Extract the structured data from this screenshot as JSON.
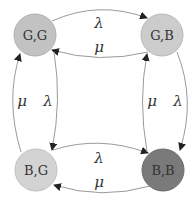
{
  "diagram": {
    "type": "state-transition",
    "nodes": [
      {
        "id": "GG",
        "label": "G,G",
        "fill": "#c2c2c2"
      },
      {
        "id": "GB",
        "label": "G,B",
        "fill": "#cccccc"
      },
      {
        "id": "BG",
        "label": "B,G",
        "fill": "#d3d3d3"
      },
      {
        "id": "BB",
        "label": "B,B",
        "fill": "#7a7a7a"
      }
    ],
    "edges": [
      {
        "from": "GG",
        "to": "GB",
        "label": "λ"
      },
      {
        "from": "GB",
        "to": "GG",
        "label": "μ"
      },
      {
        "from": "BG",
        "to": "BB",
        "label": "λ"
      },
      {
        "from": "BB",
        "to": "BG",
        "label": "μ"
      },
      {
        "from": "BG",
        "to": "GG",
        "label": "μ"
      },
      {
        "from": "GG",
        "to": "BG",
        "label": "λ"
      },
      {
        "from": "BB",
        "to": "GB",
        "label": "μ"
      },
      {
        "from": "GB",
        "to": "BB",
        "label": "λ"
      }
    ]
  }
}
